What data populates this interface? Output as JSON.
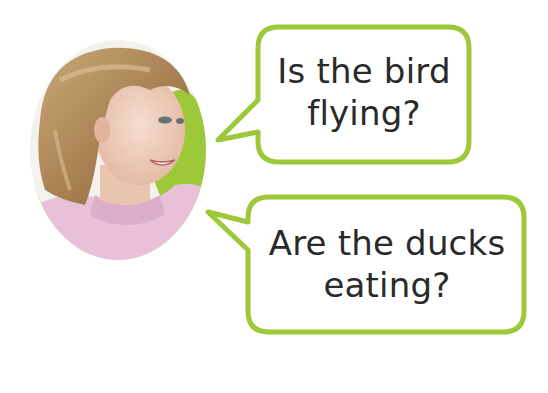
{
  "colors": {
    "accent_green": "#9cc83a",
    "sweater_pink": "#e6bcd6",
    "hair": "#b38d5c",
    "text": "#2a2a2a",
    "background": "#ffffff"
  },
  "portrait": {
    "subject": "smiling girl with shoulder-length blonde hair wearing a pink sweater",
    "icon": "girl-portrait-icon"
  },
  "bubbles": [
    {
      "line1": "Is the bird",
      "line2": "flying?"
    },
    {
      "line1": "Are the ducks",
      "line2": "eating?"
    }
  ]
}
